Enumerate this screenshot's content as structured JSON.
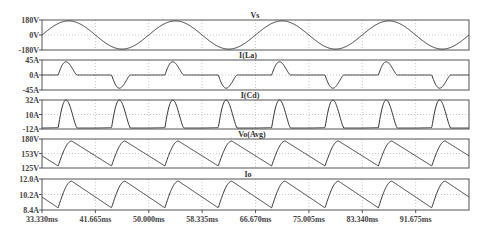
{
  "chart_data": [
    {
      "type": "line",
      "title": "Vs",
      "ylabel": "",
      "ylim": [
        -180,
        180
      ],
      "yticks": [
        "180V",
        "0V",
        "-180V"
      ],
      "description": "Sinusoidal source voltage, amplitude ~170V, 60Hz",
      "series": [
        {
          "name": "Vs",
          "amplitude": 170,
          "frequency_hz": 60
        }
      ]
    },
    {
      "type": "line",
      "title": "I(La)",
      "ylim": [
        -45,
        45
      ],
      "yticks": [
        "45A",
        "0A",
        "-45A"
      ],
      "description": "Input inductor current: alternating positive/negative pulses ~40A peak each half cycle",
      "series": [
        {
          "name": "I(La)",
          "peak": 40
        }
      ]
    },
    {
      "type": "line",
      "title": "I(Cd)",
      "ylim": [
        -12,
        32
      ],
      "yticks": [
        "32A",
        "10A",
        "-12A"
      ],
      "description": "Capacitor current: charging pulses ~32A peak every half cycle, ~-10A discharge between",
      "series": [
        {
          "name": "I(Cd)",
          "peak": 32,
          "min": -10
        }
      ]
    },
    {
      "type": "line",
      "title": "Vo(Avg)",
      "ylim": [
        125,
        180
      ],
      "yticks": [
        "180V",
        "153V",
        "125V"
      ],
      "description": "Output voltage ripple between ~130V and ~176V",
      "series": [
        {
          "name": "Vo(Avg)",
          "max": 176,
          "min": 130
        }
      ]
    },
    {
      "type": "line",
      "title": "Io",
      "ylim": [
        8.4,
        12.0
      ],
      "yticks": [
        "12.0A",
        "10.2A",
        "8.4A"
      ],
      "description": "Output current ripple between ~8.7A and ~11.8A",
      "series": [
        {
          "name": "Io",
          "max": 11.8,
          "min": 8.7
        }
      ]
    }
  ],
  "x_axis": {
    "ticks": [
      "33.330ms",
      "41.665ms",
      "50.000ms",
      "58.335ms",
      "66.670ms",
      "75.005ms",
      "83.340ms",
      "91.675ms"
    ],
    "xlim": [
      "33.330ms",
      "100.000ms"
    ],
    "grid": true
  },
  "panels": [
    {
      "title": "Vs",
      "yticks": [
        "180V",
        "0V",
        "-180V"
      ]
    },
    {
      "title": "I(La)",
      "yticks": [
        "45A",
        "0A",
        "-45A"
      ]
    },
    {
      "title": "I(Cd)",
      "yticks": [
        "32A",
        "10A",
        "-12A"
      ]
    },
    {
      "title": "Vo(Avg)",
      "yticks": [
        "180V",
        "153V",
        "125V"
      ]
    },
    {
      "title": "Io",
      "yticks": [
        "12.0A",
        "10.2A",
        "8.4A"
      ]
    }
  ]
}
